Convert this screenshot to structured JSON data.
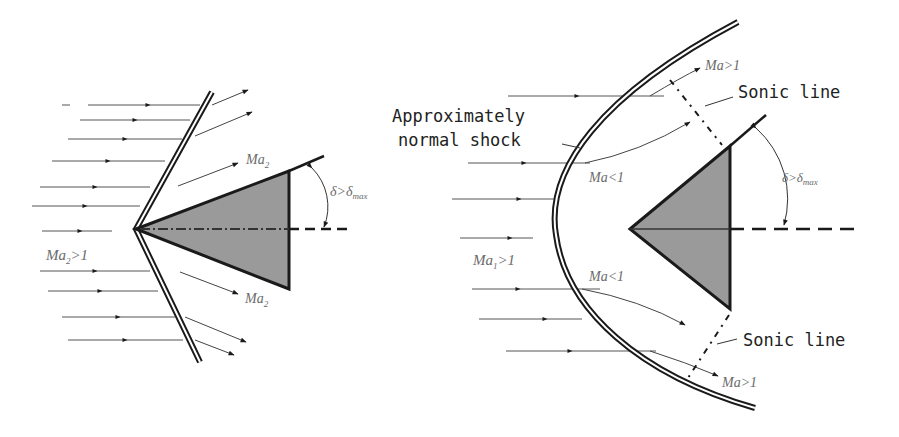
{
  "colors": {
    "background": "#ffffff",
    "ink": "#1a1a1a",
    "streamline": "#555555",
    "wedge_fill": "#9a9a9a",
    "label_italic": "#6a6a6a"
  },
  "left_panel": {
    "name": "attached oblique shock",
    "freestream_label": {
      "main": "Ma",
      "sub": "2",
      "rel": ">1"
    },
    "downstream_upper": {
      "main": "Ma",
      "sub": "2"
    },
    "downstream_lower": {
      "main": "Ma",
      "sub": "2"
    },
    "angle_label": {
      "main": "δ>δ",
      "sub": "max"
    }
  },
  "right_panel": {
    "name": "detached bow shock",
    "shock_label_line1": "Approximately",
    "shock_label_line2": "normal shock",
    "sonic_line_upper": "Sonic line",
    "sonic_line_lower": "Sonic line",
    "ma_upper_super": "Ma>1",
    "ma_lower_super": "Ma>1",
    "ma_upper_sub": "Ma<1",
    "ma_lower_sub": "Ma<1",
    "freestream_label": {
      "main": "Ma",
      "sub": "1",
      "rel": ">1"
    },
    "angle_label": {
      "main": "δ>δ",
      "sub": "max"
    }
  }
}
